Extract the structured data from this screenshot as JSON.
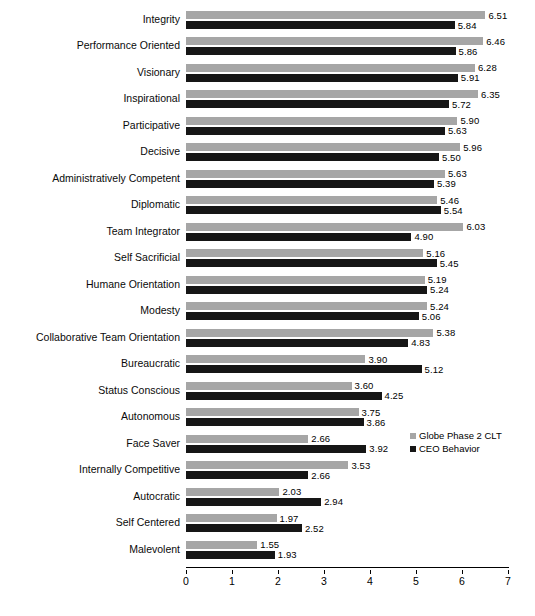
{
  "chart_data": {
    "type": "bar",
    "orientation": "horizontal",
    "title": "",
    "xlabel": "",
    "ylabel": "",
    "xlim": [
      0,
      7
    ],
    "xticks": [
      "0",
      "1",
      "2",
      "3",
      "4",
      "5",
      "6",
      "7"
    ],
    "grid": false,
    "legend_position": "inside-right",
    "categories": [
      "Integrity",
      "Performance Oriented",
      "Visionary",
      "Inspirational",
      "Participative",
      "Decisive",
      "Administratively Competent",
      "Diplomatic",
      "Team Integrator",
      "Self Sacrificial",
      "Humane Orientation",
      "Modesty",
      "Collaborative Team Orientation",
      "Bureaucratic",
      "Status Conscious",
      "Autonomous",
      "Face Saver",
      "Internally Competitive",
      "Autocratic",
      "Self Centered",
      "Malevolent"
    ],
    "series": [
      {
        "name": "Globe Phase 2 CLT",
        "color": "#a6a6a6",
        "values": [
          6.51,
          6.46,
          6.28,
          6.35,
          5.9,
          5.96,
          5.63,
          5.46,
          6.03,
          5.16,
          5.19,
          5.24,
          5.38,
          3.9,
          3.6,
          3.75,
          2.66,
          3.53,
          2.03,
          1.97,
          1.55
        ],
        "labels": [
          "6.51",
          "6.46",
          "6.28",
          "6.35",
          "5.90",
          "5.96",
          "5.63",
          "5.46",
          "6.03",
          "5.16",
          "5.19",
          "5.24",
          "5.38",
          "3.90",
          "3.60",
          "3.75",
          "2.66",
          "3.53",
          "2.03",
          "1.97",
          "1.55"
        ]
      },
      {
        "name": "CEO Behavior",
        "color": "#161616",
        "values": [
          5.84,
          5.86,
          5.91,
          5.72,
          5.63,
          5.5,
          5.39,
          5.54,
          4.9,
          5.45,
          5.24,
          5.06,
          4.83,
          5.12,
          4.25,
          3.86,
          3.92,
          2.66,
          2.94,
          2.52,
          1.93
        ],
        "labels": [
          "5.84",
          "5.86",
          "5.91",
          "5.72",
          "5.63",
          "5.50",
          "5.39",
          "5.54",
          "4.90",
          "5.45",
          "5.24",
          "5.06",
          "4.83",
          "5.12",
          "4.25",
          "3.86",
          "3.92",
          "2.66",
          "2.94",
          "2.52",
          "1.93"
        ]
      }
    ]
  }
}
